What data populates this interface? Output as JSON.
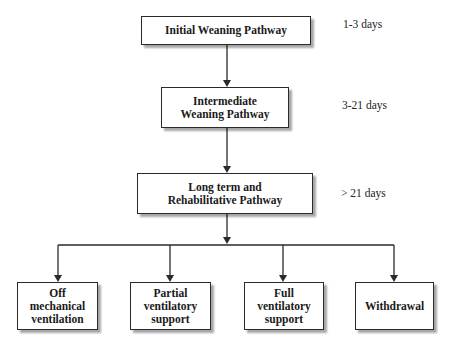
{
  "stages": [
    {
      "label": "Initial Weaning Pathway",
      "duration": "1-3 days"
    },
    {
      "label": "Intermediate Weaning Pathway",
      "duration": "3-21 days"
    },
    {
      "label": "Long term and Rehabilitative Pathway",
      "duration": "> 21 days"
    }
  ],
  "outcomes": [
    {
      "label": "Off mechanical ventilation"
    },
    {
      "label": "Partial ventilatory support"
    },
    {
      "label": "Full ventilatory support"
    },
    {
      "label": "Withdrawal"
    }
  ]
}
